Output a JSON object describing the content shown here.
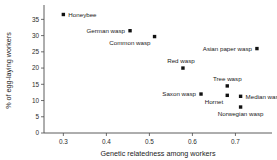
{
  "chart_data": {
    "type": "scatter",
    "title": "",
    "xlabel": "Genetic relatedness among workers",
    "ylabel": "% of egg-laying workers",
    "xlim": [
      0.255,
      0.785
    ],
    "ylim": [
      0,
      38.5
    ],
    "xticks": [
      "0.3",
      "0.4",
      "0.5",
      "0.6",
      "0.7"
    ],
    "xtick_values": [
      0.3,
      0.4,
      0.5,
      0.6,
      0.7
    ],
    "yticks": [
      "0",
      "5",
      "10",
      "15",
      "20",
      "25",
      "30",
      "35"
    ],
    "ytick_values": [
      0,
      5,
      10,
      15,
      20,
      25,
      30,
      35
    ],
    "grid": false,
    "legend": "none",
    "marker_color": "#111111",
    "axis_color": "#4a4a4a",
    "points": [
      {
        "label": "Honeybee",
        "x": 0.3,
        "y": 36.5,
        "label_pos": "right"
      },
      {
        "label": "German wasp",
        "x": 0.455,
        "y": 31.5,
        "label_pos": "left"
      },
      {
        "label": "Common wasp",
        "x": 0.512,
        "y": 29.7,
        "label_pos": "below-left"
      },
      {
        "label": "Red wasp",
        "x": 0.578,
        "y": 20.0,
        "label_pos": "above-left"
      },
      {
        "label": "Asian paper wasp",
        "x": 0.75,
        "y": 26.0,
        "label_pos": "left"
      },
      {
        "label": "Saxon wasp",
        "x": 0.62,
        "y": 12.0,
        "label_pos": "left"
      },
      {
        "label": "Tree wasp",
        "x": 0.681,
        "y": 14.5,
        "label_pos": "above"
      },
      {
        "label": "Hornet",
        "x": 0.681,
        "y": 11.6,
        "label_pos": "below-left"
      },
      {
        "label": "Median wasp",
        "x": 0.712,
        "y": 11.3,
        "label_pos": "right"
      },
      {
        "label": "Norwegian wasp",
        "x": 0.712,
        "y": 8.0,
        "label_pos": "below"
      }
    ]
  }
}
